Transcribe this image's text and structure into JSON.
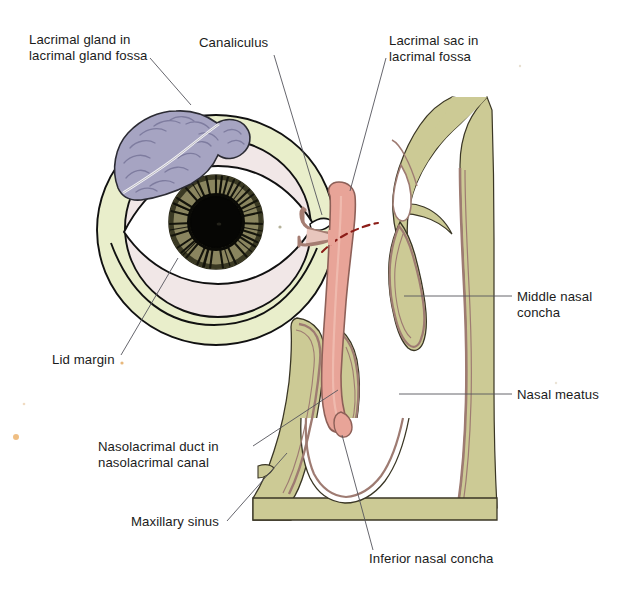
{
  "figure": {
    "type": "anatomical-illustration",
    "background_color": "#ffffff"
  },
  "labels": [
    {
      "id": "lacrimal-gland",
      "lines": [
        "Lacrimal gland in",
        "lacrimal gland fossa"
      ],
      "text_x": 29,
      "text_y": 44,
      "anchor": "start",
      "leader": "M 150,58 L 191,105"
    },
    {
      "id": "canaliculus",
      "lines": [
        "Canaliculus"
      ],
      "text_x": 199,
      "text_y": 47,
      "anchor": "start",
      "leader": "M 274,55 L 322,215"
    },
    {
      "id": "lacrimal-sac",
      "lines": [
        "Lacrimal sac in",
        "lacrimal fossa"
      ],
      "text_x": 389,
      "text_y": 45,
      "anchor": "start",
      "leader": "M 386,58 L 350,191"
    },
    {
      "id": "middle-nasal-concha",
      "lines": [
        "Middle nasal",
        "concha"
      ],
      "text_x": 517,
      "text_y": 301,
      "anchor": "start",
      "leader": "M 512,296 L 404,296"
    },
    {
      "id": "nasal-meatus",
      "lines": [
        "Nasal meatus"
      ],
      "text_x": 517,
      "text_y": 399,
      "anchor": "start",
      "leader": "M 512,394 L 399,394"
    },
    {
      "id": "lid-margin",
      "lines": [
        "Lid margin"
      ],
      "text_x": 52,
      "text_y": 364,
      "anchor": "start",
      "leader": "M 121,355 L 178,258"
    },
    {
      "id": "nasolacrimal-duct",
      "lines": [
        "Nasolacrimal duct in",
        "nasolacrimal canal"
      ],
      "text_x": 98,
      "text_y": 451,
      "anchor": "start",
      "leader": "M 253,446 L 338,390"
    },
    {
      "id": "maxillary-sinus",
      "lines": [
        "Maxillary sinus"
      ],
      "text_x": 131,
      "text_y": 526,
      "anchor": "start",
      "leader": "M 227,521 L 287,453"
    },
    {
      "id": "inferior-nasal-concha",
      "lines": [
        "Inferior nasal concha"
      ],
      "text_x": 369,
      "text_y": 563,
      "anchor": "start",
      "leader": "M 373,550 L 342,435"
    }
  ],
  "colors": {
    "bone": "#ccca95",
    "bone_light": "#d6d4a4",
    "mucosa": "#c9a79c",
    "mucosa_line": "#9e7b72",
    "orbit_pale": "#e9eecb",
    "sclera": "#ffffff",
    "conjunctiva": "#f1e7e7",
    "iris": "#8a8560",
    "iris_dark": "#51502f",
    "pupil": "#060604",
    "gland": "#a6a4c2",
    "gland_dark": "#8a88ab",
    "duct": "#e8a498",
    "duct_outline": "#8d6058",
    "outline": "#111111",
    "leader": "#55555c",
    "text": "#1b1b1b",
    "dashed_marker": "#8c1d18",
    "speck": "#e0a050"
  },
  "structures": [
    {
      "id": "lacrimal-gland-body",
      "name": "lacrimal gland",
      "fill": "#a6a4c2"
    },
    {
      "id": "eyeball",
      "name": "eyeball and orbit",
      "fill": "#e9eecb"
    },
    {
      "id": "iris",
      "name": "iris",
      "fill": "#8a8560"
    },
    {
      "id": "pupil",
      "name": "pupil",
      "fill": "#060604"
    },
    {
      "id": "canaliculi",
      "name": "superior and inferior canaliculi",
      "fill": "#e8c6bd"
    },
    {
      "id": "lacrimal-sac-body",
      "name": "lacrimal sac",
      "fill": "#e8a498"
    },
    {
      "id": "nasolacrimal-duct-body",
      "name": "nasolacrimal duct",
      "fill": "#e8a498"
    },
    {
      "id": "middle-concha",
      "name": "middle nasal concha",
      "fill": "#ccca95"
    },
    {
      "id": "inferior-concha",
      "name": "inferior nasal concha",
      "fill": "#ccca95"
    },
    {
      "id": "lateral-nasal-wall",
      "name": "lateral nasal wall",
      "fill": "#ccca95"
    },
    {
      "id": "maxilla",
      "name": "maxilla / maxillary sinus wall",
      "fill": "#ccca95"
    }
  ]
}
